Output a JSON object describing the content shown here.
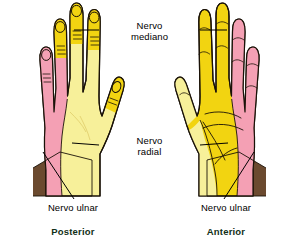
{
  "figure": {
    "background": "#ffffff",
    "labels": {
      "nerve_median_line1": "Nervo",
      "nerve_median_line2": "mediano",
      "nerve_radial_line1": "Nervo",
      "nerve_radial_line2": "radial",
      "nerve_ulnar_left": "Nervo ulnar",
      "nerve_ulnar_right": "Nervo ulnar",
      "view_left": "Posterior",
      "view_right": "Anterior"
    },
    "colors": {
      "ulnar_territory": "#F4A0B4",
      "median_territory_pale": "#F7F09A",
      "median_territory_bright": "#F2D411",
      "radial_territory": "#F7F09A",
      "forearm": "#6B4A2F",
      "outline": "#1a1208",
      "leader_line": "#000000",
      "view_label": "#123018",
      "text": "#000000"
    },
    "panels": [
      {
        "name": "posterior-hand",
        "view": "Posterior",
        "description": "Dorsal view of left hand: ulnar (pink) territory along medial border and little/ring fingers, median/radial (yellow) over remainder, brown forearm at wrist"
      },
      {
        "name": "anterior-hand",
        "view": "Anterior",
        "description": "Palmar view of right hand: ulnar (pink) territory along medial border and little/ring fingers, median (yellow) over thenar and lateral digits, brown forearm at wrist"
      }
    ]
  }
}
